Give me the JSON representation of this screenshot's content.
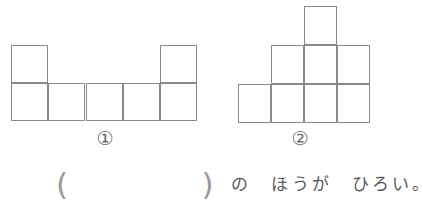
{
  "page": {
    "background_color": "#ffffff",
    "line_color": "#8a8a8a",
    "text_color": "#5a5a5a"
  },
  "figures": [
    {
      "id": "figure-1",
      "label": "①",
      "label_plain": "1",
      "cell_count": 7,
      "description": "two-row arrangement: bottom row of 5 squares with one extra square stacked on the far-left and far-right columns",
      "cell_width": 37,
      "cell_height": 38,
      "cells": [
        {
          "x": 11,
          "y": 45
        },
        {
          "x": 160,
          "y": 45
        },
        {
          "x": 11,
          "y": 83
        },
        {
          "x": 48,
          "y": 83
        },
        {
          "x": 86,
          "y": 83
        },
        {
          "x": 123,
          "y": 83
        },
        {
          "x": 160,
          "y": 83
        }
      ]
    },
    {
      "id": "figure-2",
      "label": "②",
      "label_plain": "2",
      "cell_count": 8,
      "description": "stepped pyramid: bottom row of 4 squares, middle row of 3 squares, single square on top",
      "cell_width": 33,
      "cell_height": 39,
      "cells": [
        {
          "x": 89,
          "y": 6
        },
        {
          "x": 56,
          "y": 45
        },
        {
          "x": 89,
          "y": 45
        },
        {
          "x": 122,
          "y": 45
        },
        {
          "x": 23,
          "y": 84
        },
        {
          "x": 56,
          "y": 84
        },
        {
          "x": 89,
          "y": 84
        },
        {
          "x": 122,
          "y": 84
        }
      ]
    }
  ],
  "question": {
    "blank": "(　　　　)",
    "tail": "の　ほうが　ひろい。",
    "full_text": "(　　　　) の ほうが ひろい。"
  }
}
